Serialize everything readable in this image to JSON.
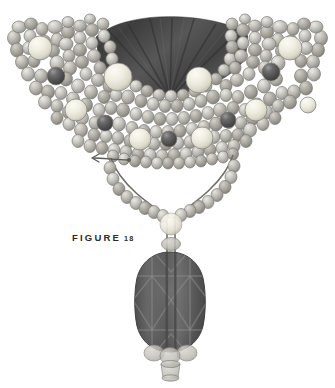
{
  "figure": {
    "caption_label": "FIGURE",
    "caption_number": "18",
    "background_color": "#ffffff"
  },
  "palette": {
    "bead_light": "#d5d4cf",
    "bead_mid": "#b9b8b2",
    "bead_shadow": "#8e8d87",
    "bead_outline": "#7e7d77",
    "bead_cream_highlight": "#f4f3ea",
    "bead_cream": "#e9e7da",
    "bead_dark": "#4f4f4f",
    "bead_dark_highlight": "#8a8a8a",
    "drape_dark": "#4b4b4b",
    "drape_darker": "#3a3a3a",
    "pendant_body": "#5d5d5d",
    "pendant_facet_light": "#8c8c8c",
    "pendant_facet_dark": "#4a4a4a",
    "pendant_outline": "#3f3f3f",
    "thread": "#6e6d67",
    "arrow": "#5a5a56",
    "caption_text": "#2b2b2b"
  },
  "components": {
    "drape": {
      "name": "dark-draped-fabric-fan",
      "fold_lines": 7,
      "description": "dark gray draped fan at top center with radiating fold lines"
    },
    "collar": {
      "name": "beaded-collar",
      "description": "dense grayscale bead mesh forming a V-shaped collar",
      "accent_dark_beads": 5,
      "large_cream_beads": 9,
      "bead_total_estimate": 190
    },
    "bottom_strand": {
      "name": "horizontal-bead-strand",
      "description": "single horizontal strand of beads along the bottom of the collar"
    },
    "v_strands": {
      "name": "v-shaped-bead-strands",
      "description": "two bead strands descending in a V to the pendant drop"
    },
    "arrow": {
      "name": "pointer-arrow",
      "direction": "left",
      "description": "thin arrow pointing left from a bead on the bottom strand"
    },
    "pendant": {
      "name": "faceted-oval-pendant",
      "description": "large dark faceted oval gemstone pendant with diamond facet pattern"
    },
    "pendant_drop_beads": {
      "name": "pendant-drop-beads",
      "count": 4,
      "description": "three translucent round beads and one small cylinder bead below the pendant"
    }
  }
}
